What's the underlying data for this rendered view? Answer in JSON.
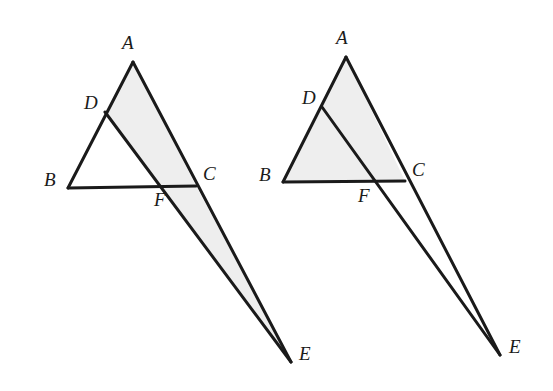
{
  "figure": {
    "background_color": "#ffffff",
    "stroke_color": "#1a1a1a",
    "shade_color": "#eeeeee",
    "shade_stroke_color": "#d6d6d6"
  },
  "diagrams": [
    {
      "id": "left",
      "name": "left-diagram",
      "shaded_region": "ADEC",
      "shaded_region_description": "Quadrilateral A-D-E-C between line DE and line AC",
      "points": {
        "A": {
          "x": 133,
          "y": 62
        },
        "B": {
          "x": 68,
          "y": 188
        },
        "C": {
          "x": 196,
          "y": 186
        },
        "D": {
          "x": 105,
          "y": 112
        },
        "E": {
          "x": 291,
          "y": 362
        },
        "F": {
          "x": 166,
          "y": 187
        }
      },
      "segments": [
        {
          "from": "A",
          "to": "B"
        },
        {
          "from": "B",
          "to": "C"
        },
        {
          "from": "A",
          "to": "E"
        },
        {
          "from": "D",
          "to": "E"
        }
      ],
      "labels": [
        {
          "text": "A",
          "x": 122,
          "y": 33
        },
        {
          "text": "B",
          "x": 44,
          "y": 170
        },
        {
          "text": "C",
          "x": 203,
          "y": 164
        },
        {
          "text": "D",
          "x": 84,
          "y": 93
        },
        {
          "text": "E",
          "x": 299,
          "y": 344
        },
        {
          "text": "F",
          "x": 154,
          "y": 190
        }
      ]
    },
    {
      "id": "right",
      "name": "right-diagram",
      "shaded_region": "ABC",
      "shaded_region_description": "Triangle A-B-C fully shaded",
      "points": {
        "A": {
          "x": 346,
          "y": 57
        },
        "B": {
          "x": 283,
          "y": 182
        },
        "C": {
          "x": 405,
          "y": 181
        },
        "D": {
          "x": 322,
          "y": 107
        },
        "E": {
          "x": 500,
          "y": 355
        },
        "F": {
          "x": 370,
          "y": 182
        }
      },
      "segments": [
        {
          "from": "A",
          "to": "B"
        },
        {
          "from": "B",
          "to": "C"
        },
        {
          "from": "A",
          "to": "E"
        },
        {
          "from": "D",
          "to": "E"
        }
      ],
      "labels": [
        {
          "text": "A",
          "x": 336,
          "y": 28
        },
        {
          "text": "B",
          "x": 259,
          "y": 165
        },
        {
          "text": "C",
          "x": 412,
          "y": 160
        },
        {
          "text": "D",
          "x": 302,
          "y": 88
        },
        {
          "text": "E",
          "x": 509,
          "y": 337
        },
        {
          "text": "F",
          "x": 358,
          "y": 186
        }
      ]
    }
  ]
}
